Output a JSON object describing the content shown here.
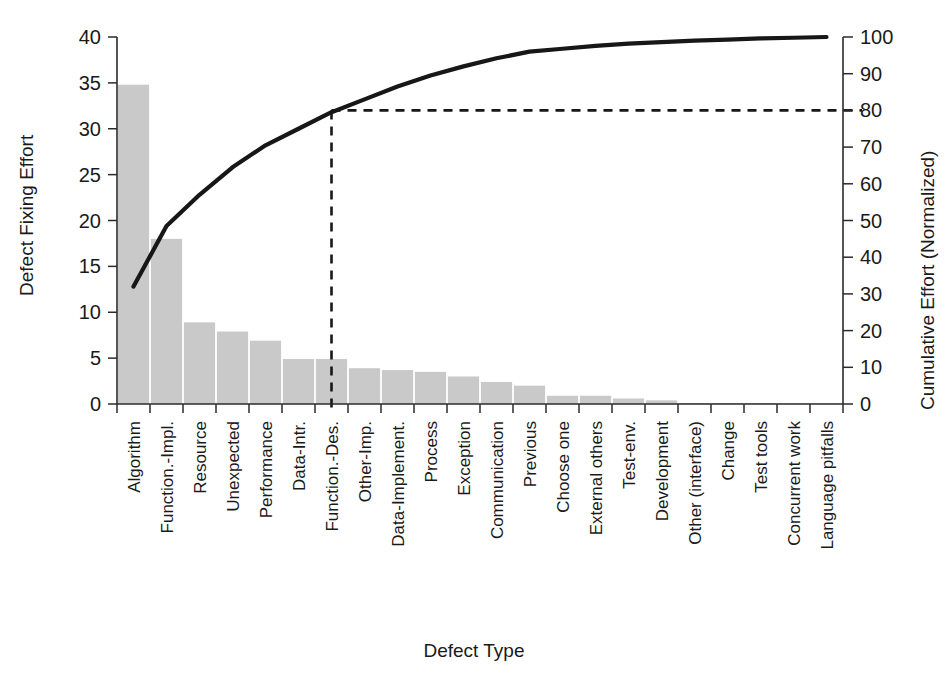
{
  "chart_data": {
    "type": "bar",
    "title": "",
    "subtitle": "",
    "xlabel": "Defect Type",
    "ylabel": "Defect Fixing Effort",
    "y2label": "Cumulative Effort (Normalized)",
    "ylim": [
      0,
      40
    ],
    "y2lim": [
      0,
      100
    ],
    "yticks": [
      0,
      5,
      10,
      15,
      20,
      25,
      30,
      35,
      40
    ],
    "y2ticks": [
      0,
      10,
      20,
      30,
      40,
      50,
      60,
      70,
      80,
      90,
      100
    ],
    "grid": false,
    "legend": null,
    "categories": [
      "Algorithm",
      "Function.-Impl.",
      "Resource",
      "Unexpected",
      "Performance",
      "Data-Intr.",
      "Function.-Des.",
      "Other-Imp.",
      "Data-Implement.",
      "Process",
      "Exception",
      "Communication",
      "Previous",
      "Choose one",
      "External others",
      "Test-env.",
      "Development",
      "Other (interface)",
      "Change",
      "Test tools",
      "Concurrent work",
      "Language pitfalls"
    ],
    "values": [
      34.8,
      18.0,
      8.9,
      7.9,
      6.9,
      4.9,
      4.9,
      3.9,
      3.7,
      3.5,
      3.0,
      2.4,
      2.0,
      0.9,
      0.9,
      0.6,
      0.4,
      0.1,
      0.1,
      0.1,
      0.05,
      0.05
    ],
    "series": [
      {
        "name": "Defect Fixing Effort",
        "type": "bar",
        "axis": "left",
        "values": [
          34.8,
          18.0,
          8.9,
          7.9,
          6.9,
          4.9,
          4.9,
          3.9,
          3.7,
          3.5,
          3.0,
          2.4,
          2.0,
          0.9,
          0.9,
          0.6,
          0.4,
          0.1,
          0.1,
          0.1,
          0.05,
          0.05
        ]
      },
      {
        "name": "Cumulative Effort (Normalized)",
        "type": "line",
        "axis": "right",
        "values": [
          32.0,
          48.5,
          57.0,
          64.5,
          70.5,
          75.0,
          79.5,
          83.0,
          86.5,
          89.5,
          92.0,
          94.2,
          96.0,
          96.8,
          97.6,
          98.2,
          98.6,
          99.0,
          99.3,
          99.6,
          99.8,
          100.0
        ]
      }
    ],
    "annotations": [
      {
        "name": "eighty-percent-reference",
        "kind": "dashed-lines",
        "y_value": 80,
        "y_axis": "right",
        "x_category": "Function.-Des.",
        "description": "Dashed horizontal line at 80% cumulative effort and dashed vertical line dropping to the Function.-Des. category"
      }
    ]
  },
  "axes": {
    "left": {
      "title": "Defect Fixing Effort",
      "ticks": [
        "0",
        "5",
        "10",
        "15",
        "20",
        "25",
        "30",
        "35",
        "40"
      ]
    },
    "right": {
      "title": "Cumulative Effort (Normalized)",
      "ticks": [
        "0",
        "10",
        "20",
        "30",
        "40",
        "50",
        "60",
        "70",
        "80",
        "90",
        "100"
      ]
    },
    "bottom": {
      "title": "Defect Type"
    }
  },
  "colors": {
    "bar_fill": "#c9c9c9",
    "curve": "#171717",
    "axis": "#2b2b2b",
    "background": "#ffffff",
    "text": "#1a1a1a"
  }
}
